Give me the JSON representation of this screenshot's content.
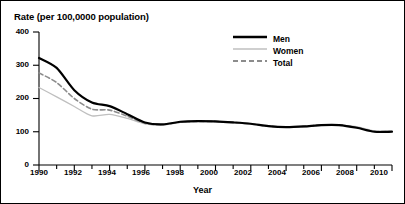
{
  "figure": {
    "title": "Rate (per 100,0000 population)",
    "xlabel": "Year"
  },
  "legend": {
    "items": [
      {
        "label": "Men",
        "style": "solid-thick",
        "color": "#000000"
      },
      {
        "label": "Women",
        "style": "solid-thin",
        "color": "#bfbfbf"
      },
      {
        "label": "Total",
        "style": "dashed",
        "color": "#8c8c8c"
      }
    ]
  },
  "chart_data": {
    "type": "line",
    "title": "Rate (per 100,0000 population)",
    "xlabel": "Year",
    "ylabel": "Rate (per 100,0000 population)",
    "xlim": [
      1990,
      2010
    ],
    "ylim": [
      0,
      400
    ],
    "yticks": [
      0,
      100,
      200,
      300,
      400
    ],
    "xticks": [
      1990,
      1992,
      1994,
      1996,
      1998,
      2000,
      2002,
      2004,
      2006,
      2008,
      2010
    ],
    "x_minor_tick_interval": 1,
    "grid": false,
    "legend_position": "upper-right",
    "x": [
      1990,
      1991,
      1992,
      1993,
      1994,
      1995,
      1996,
      1997,
      1998,
      1999,
      2000,
      2001,
      2002,
      2003,
      2004,
      2005,
      2006,
      2007,
      2008,
      2009,
      2010
    ],
    "series": [
      {
        "name": "Men",
        "color": "#000000",
        "linestyle": "solid",
        "linewidth": 2.2,
        "values": [
          322,
          292,
          225,
          188,
          177,
          153,
          128,
          122,
          130,
          132,
          131,
          128,
          124,
          117,
          114,
          116,
          120,
          120,
          112,
          100,
          100
        ]
      },
      {
        "name": "Women",
        "color": "#bfbfbf",
        "linestyle": "solid",
        "linewidth": 1.3,
        "values": [
          233,
          205,
          176,
          148,
          152,
          140,
          124,
          120,
          128,
          131,
          130,
          127,
          123,
          116,
          113,
          115,
          119,
          120,
          115,
          103,
          103
        ]
      },
      {
        "name": "Total",
        "color": "#8c8c8c",
        "linestyle": "dashed",
        "linewidth": 1.6,
        "values": [
          277,
          248,
          200,
          168,
          165,
          147,
          126,
          121,
          129,
          131,
          131,
          128,
          124,
          117,
          114,
          116,
          120,
          120,
          113,
          101,
          101
        ]
      }
    ]
  }
}
